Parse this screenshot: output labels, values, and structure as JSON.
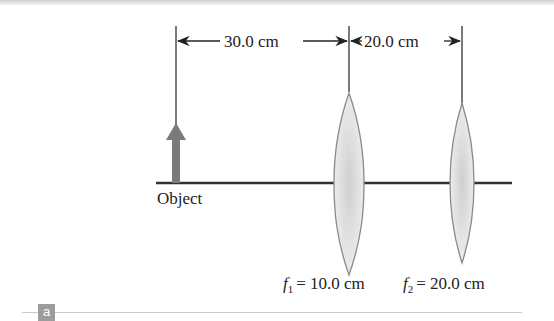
{
  "figure": {
    "panel_label": "a",
    "dimensions": [
      {
        "label": "30.0 cm",
        "from": "object",
        "to": "lens1"
      },
      {
        "label": "20.0 cm",
        "from": "lens1",
        "to": "lens2"
      }
    ],
    "object_label": "Object",
    "lenses": [
      {
        "name": "lens1",
        "focal_label_var": "f",
        "focal_label_sub": "1",
        "focal_label_value": "= 10.0 cm"
      },
      {
        "name": "lens2",
        "focal_label_var": "f",
        "focal_label_sub": "2",
        "focal_label_value": "= 20.0 cm"
      }
    ],
    "colors": {
      "axis": "#333333",
      "object_arrow": "#7a7a7a",
      "lens_fill": "#e2e2e2",
      "lens_edge": "#8a8a8a",
      "badge": "#9c9c9c"
    }
  }
}
